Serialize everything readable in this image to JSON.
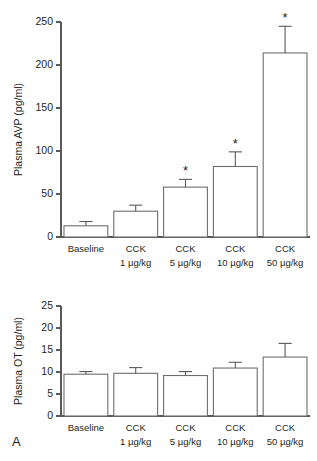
{
  "figure": {
    "panel_letter": "A",
    "background_color": "#ffffff",
    "line_color": "#58595b",
    "bar_stroke_color": "#6d6e71",
    "bar_fill_color": "#ffffff",
    "text_color": "#231f20"
  },
  "chart_data": [
    {
      "id": "avp",
      "type": "bar",
      "title": "",
      "xlabel": "",
      "ylabel": "Plasma AVP (pg/ml)",
      "ylim": [
        0,
        250
      ],
      "yticks": [
        0,
        50,
        100,
        150,
        200,
        250
      ],
      "ytick_labels": [
        "0",
        "50",
        "100",
        "150",
        "200",
        "250"
      ],
      "grid": false,
      "legend": "none",
      "categories": [
        "Baseline",
        "CCK\n1 µg/kg",
        "CCK\n5 µg/kg",
        "CCK\n10 µg/kg",
        "CCK\n50 µg/kg"
      ],
      "category_lines": [
        [
          "Baseline",
          ""
        ],
        [
          "CCK",
          "1 µg/kg"
        ],
        [
          "CCK",
          "5 µg/kg"
        ],
        [
          "CCK",
          "10 µg/kg"
        ],
        [
          "CCK",
          "50 µg/kg"
        ]
      ],
      "values": [
        13,
        30,
        58,
        82,
        214
      ],
      "errors": [
        5,
        7,
        9,
        17,
        31
      ],
      "significance": [
        "",
        "",
        "*",
        "*",
        "*"
      ]
    },
    {
      "id": "ot",
      "type": "bar",
      "title": "",
      "xlabel": "",
      "ylabel": "Plasma OT (pg/ml)",
      "ylim": [
        0,
        25
      ],
      "yticks": [
        0,
        5,
        10,
        15,
        20,
        25
      ],
      "ytick_labels": [
        "0",
        "5",
        "10",
        "15",
        "20",
        "25"
      ],
      "grid": false,
      "legend": "none",
      "categories": [
        "Baseline",
        "CCK\n1 µg/kg",
        "CCK\n5 µg/kg",
        "CCK\n10 µg/kg",
        "CCK\n50 µg/kg"
      ],
      "category_lines": [
        [
          "Baseline",
          ""
        ],
        [
          "CCK",
          "1 µg/kg"
        ],
        [
          "CCK",
          "5 µg/kg"
        ],
        [
          "CCK",
          "10 µg/kg"
        ],
        [
          "CCK",
          "50 µg/kg"
        ]
      ],
      "values": [
        9.5,
        9.7,
        9.2,
        10.9,
        13.4
      ],
      "errors": [
        0.6,
        1.3,
        0.9,
        1.3,
        3.1
      ],
      "significance": [
        "",
        "",
        "",
        "",
        ""
      ]
    }
  ]
}
